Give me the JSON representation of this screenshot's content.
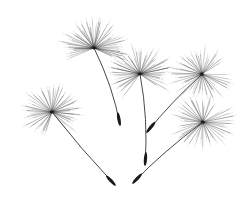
{
  "image": {
    "subject": "Five dandelion seeds (pappus) drifting on white background",
    "background": "#ffffff",
    "ink": "#1a1a1a",
    "width": 249,
    "height": 198
  },
  "seeds": [
    {
      "name": "seed-top-left",
      "head": [
        94,
        48
      ],
      "tip": [
        120,
        125
      ],
      "radius": 32,
      "bend": 6,
      "rays": 46,
      "spread": [
        150,
        390
      ]
    },
    {
      "name": "seed-left",
      "head": [
        52,
        112
      ],
      "tip": [
        115,
        185
      ],
      "radius": 30,
      "bend": -3,
      "rays": 48,
      "spread": [
        100,
        420
      ]
    },
    {
      "name": "seed-center",
      "head": [
        140,
        74
      ],
      "tip": [
        145,
        165
      ],
      "radius": 31,
      "bend": 6,
      "rays": 46,
      "spread": [
        120,
        400
      ]
    },
    {
      "name": "seed-upper-right",
      "head": [
        202,
        74
      ],
      "tip": [
        147,
        132
      ],
      "radius": 30,
      "bend": -4,
      "rays": 44,
      "spread": [
        0,
        330
      ]
    },
    {
      "name": "seed-lower-right",
      "head": [
        203,
        122
      ],
      "tip": [
        133,
        183
      ],
      "radius": 30,
      "bend": -6,
      "rays": 44,
      "spread": [
        -40,
        300
      ]
    }
  ]
}
